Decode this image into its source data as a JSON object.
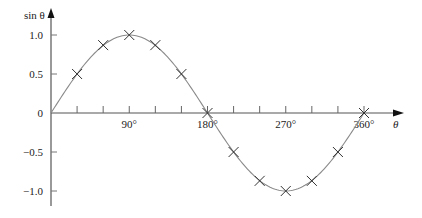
{
  "chart_data": {
    "type": "line",
    "title": "",
    "xlabel": "θ",
    "ylabel": "sin θ",
    "xlim": [
      0,
      360
    ],
    "ylim": [
      -1.0,
      1.0
    ],
    "x_tick_labels": [
      "90°",
      "180°",
      "270°",
      "360°"
    ],
    "x_tick_values": [
      90,
      180,
      270,
      360
    ],
    "x_minor_ticks": [
      30,
      60,
      90,
      120,
      150,
      180,
      210,
      240,
      270,
      300,
      330,
      360
    ],
    "y_tick_labels": [
      "1.0",
      "0.5",
      "0",
      "−0.5",
      "−1.0"
    ],
    "y_tick_values": [
      1.0,
      0.5,
      0,
      -0.5,
      -1.0
    ],
    "grid": false,
    "series": [
      {
        "name": "sin θ curve",
        "style": "smooth-line",
        "color": "#888888"
      },
      {
        "name": "sample points",
        "style": "x-markers",
        "color": "#333333",
        "x": [
          30,
          60,
          90,
          120,
          150,
          180,
          210,
          240,
          270,
          300,
          330,
          360
        ],
        "y": [
          0.5,
          0.87,
          1.0,
          0.87,
          0.5,
          0,
          -0.5,
          -0.87,
          -1.0,
          -0.87,
          -0.5,
          0
        ]
      }
    ]
  }
}
